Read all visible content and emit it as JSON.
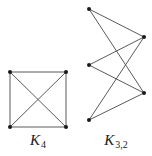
{
  "diagram": {
    "colors": {
      "background": "#ffffff",
      "edge": "#5a5a5a",
      "vertex": "#1a1a1a",
      "label": "#222222"
    },
    "graphs": [
      {
        "id": "k4",
        "name": "K",
        "subscript": "4",
        "label_position": {
          "x": 38,
          "y": 133
        },
        "vertices": [
          {
            "id": "a",
            "x": 10,
            "y": 72
          },
          {
            "id": "b",
            "x": 66,
            "y": 72
          },
          {
            "id": "c",
            "x": 10,
            "y": 127
          },
          {
            "id": "d",
            "x": 66,
            "y": 127
          }
        ],
        "edges": [
          [
            "a",
            "b"
          ],
          [
            "b",
            "d"
          ],
          [
            "d",
            "c"
          ],
          [
            "c",
            "a"
          ],
          [
            "a",
            "d"
          ],
          [
            "b",
            "c"
          ]
        ]
      },
      {
        "id": "k32",
        "name": "K",
        "subscript": "3,2",
        "label_position": {
          "x": 116,
          "y": 133
        },
        "vertices": [
          {
            "id": "l1",
            "x": 89,
            "y": 9
          },
          {
            "id": "l2",
            "x": 89,
            "y": 65
          },
          {
            "id": "l3",
            "x": 89,
            "y": 120
          },
          {
            "id": "r1",
            "x": 144,
            "y": 37
          },
          {
            "id": "r2",
            "x": 144,
            "y": 93
          }
        ],
        "edges": [
          [
            "l1",
            "r1"
          ],
          [
            "l1",
            "r2"
          ],
          [
            "l2",
            "r1"
          ],
          [
            "l2",
            "r2"
          ],
          [
            "l3",
            "r1"
          ],
          [
            "l3",
            "r2"
          ]
        ]
      }
    ]
  }
}
